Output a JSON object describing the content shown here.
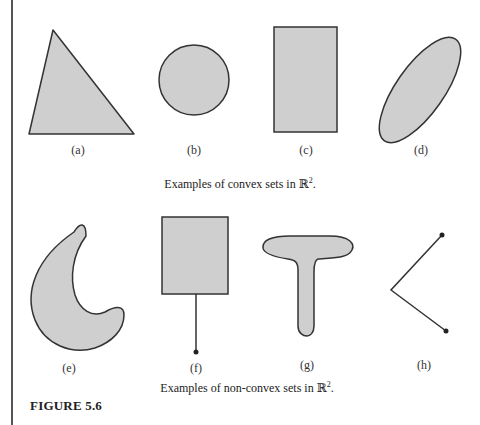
{
  "figure": {
    "title": "FIGURE 5.6",
    "shape_fill": "#cfcfcf",
    "stroke": "#333333"
  },
  "convex": {
    "caption_prefix": "Examples of convex sets in ",
    "space": "ℝ",
    "exponent": "2",
    "caption_suffix": ".",
    "items": [
      {
        "label": "(a)",
        "shape": "triangle"
      },
      {
        "label": "(b)",
        "shape": "circle"
      },
      {
        "label": "(c)",
        "shape": "rectangle"
      },
      {
        "label": "(d)",
        "shape": "tilted-ellipse"
      }
    ]
  },
  "nonconvex": {
    "caption_prefix": "Examples of non-convex sets in ",
    "space": "ℝ",
    "exponent": "2",
    "caption_suffix": ".",
    "items": [
      {
        "label": "(e)",
        "shape": "crescent"
      },
      {
        "label": "(f)",
        "shape": "rectangle-with-segment"
      },
      {
        "label": "(g)",
        "shape": "t-shape"
      },
      {
        "label": "(h)",
        "shape": "angled-polyline"
      }
    ]
  }
}
